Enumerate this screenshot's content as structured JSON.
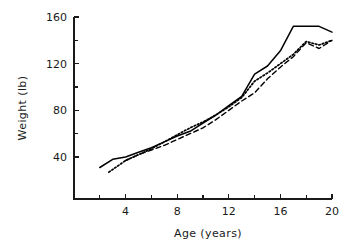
{
  "chart_data": {
    "type": "line",
    "title": "",
    "xlabel": "Age  (years)",
    "ylabel": "Weight  (lb)",
    "xlim": [
      0,
      20
    ],
    "ylim": [
      4,
      160
    ],
    "grid": false,
    "legend": "none",
    "x_ticks_major": [
      4,
      8,
      12,
      16,
      20
    ],
    "x_ticks_minor": [
      2,
      6,
      10,
      14,
      18
    ],
    "x_tick_labels": [
      "4",
      "8",
      "12",
      "16",
      "20"
    ],
    "y_ticks_major": [
      40,
      80,
      120,
      160
    ],
    "y_ticks_minor": [
      60,
      100,
      140
    ],
    "y_tick_labels": [
      "40",
      "80",
      "120",
      "160"
    ],
    "series": [
      {
        "name": "solid-curve",
        "style": "solid",
        "color": "#000000",
        "x": [
          2,
          3,
          4,
          5,
          6,
          7,
          8,
          9,
          10,
          11,
          12,
          13,
          14,
          15,
          16,
          17,
          19,
          20
        ],
        "values": [
          31,
          38,
          40,
          44,
          48,
          53,
          58,
          62,
          69,
          76,
          84,
          92,
          111,
          118,
          131,
          152,
          152,
          147
        ]
      },
      {
        "name": "dotted-curve",
        "style": "dotted",
        "color": "#000000",
        "x": [
          2.7,
          4,
          5,
          6,
          7,
          8,
          9,
          10,
          11,
          12,
          13,
          14,
          15,
          16,
          17,
          18,
          19,
          20
        ],
        "values": [
          27,
          37,
          42,
          47,
          53,
          59,
          65,
          70,
          76,
          83,
          91,
          105,
          112,
          120,
          128,
          139,
          136,
          140
        ]
      },
      {
        "name": "dashed-curve",
        "style": "dashed",
        "color": "#000000",
        "x": [
          4,
          5,
          6,
          7,
          8,
          9,
          10,
          11,
          12,
          13,
          14,
          15,
          16,
          17,
          18,
          19,
          20
        ],
        "values": [
          37,
          42,
          46,
          50,
          55,
          60,
          65,
          72,
          80,
          88,
          95,
          107,
          117,
          126,
          138,
          133,
          140
        ]
      }
    ]
  }
}
